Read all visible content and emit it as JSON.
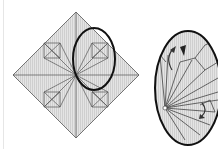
{
  "figure": {
    "panels": [
      {
        "id": "crease-pattern",
        "description": "Square crease pattern rotated 45 degrees with highlight ellipse"
      },
      {
        "id": "detail-view",
        "description": "Enlarged elliptical detail of folded flap with arrows"
      }
    ],
    "colors": {
      "paper": "#d9d9d9",
      "line": "#555555",
      "highlight": "#111111",
      "background": "#ffffff"
    }
  }
}
